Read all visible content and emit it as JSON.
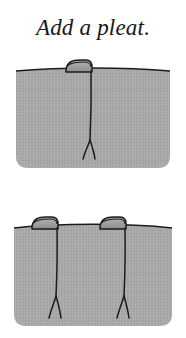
{
  "page": {
    "background_color": "#ffffff",
    "width": 186,
    "height": 338
  },
  "title": {
    "text": "Add a pleat.",
    "color": "#171717",
    "style": "italic-serif"
  },
  "palette": {
    "fabric_fill": "#a9a9a9",
    "fabric_fill_dark": "#9d9d9d",
    "fabric_texture": "#9f9f9f",
    "outline": "#1c1c1c",
    "tab_fill": "#a4a4a4",
    "tab_highlight": "#c0c0c0",
    "background": "#ffffff"
  },
  "figures": [
    {
      "id": "figure-single",
      "label": "fabric panel with one pleat",
      "pleat_count": 1,
      "pleat_labels": [
        "pleat-tab-1"
      ],
      "fold_labels": [
        "fold-line-1"
      ],
      "caption": ""
    },
    {
      "id": "figure-double",
      "label": "fabric panel with two pleats",
      "pleat_count": 2,
      "pleat_labels": [
        "pleat-tab-1",
        "pleat-tab-2"
      ],
      "fold_labels": [
        "fold-line-1",
        "fold-line-2"
      ],
      "caption": ""
    }
  ]
}
